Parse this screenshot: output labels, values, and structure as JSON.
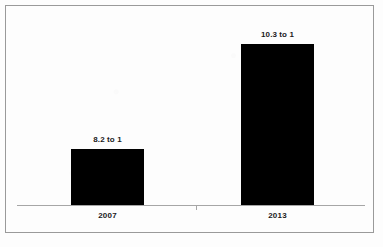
{
  "chart_data": {
    "type": "bar",
    "title": "",
    "subtitle": "",
    "xlabel": "",
    "ylabel": "",
    "categories": [
      "2007",
      "2013"
    ],
    "values": [
      8.2,
      10.3
    ],
    "value_labels": [
      "8.2 to 1",
      "10.3 to 1"
    ],
    "series": [
      {
        "name": "Ratio",
        "values": [
          8.2,
          10.3
        ]
      }
    ],
    "ylim": [
      7.1,
      10.9
    ],
    "grid": false,
    "legend": "none",
    "y_axis_visible": false,
    "x_axis_visible": true,
    "bar_color": "#000000",
    "annotations": []
  },
  "chart": {
    "frame_color": "#9a9a9a",
    "background_color": "#fdfdfd",
    "axis_color": "#a6a6a6",
    "label_color": "#1a1a1a",
    "bars": [
      {
        "category": "2007",
        "value_label": "8.2 to 1"
      },
      {
        "category": "2013",
        "value_label": "10.3 to 1"
      }
    ]
  }
}
